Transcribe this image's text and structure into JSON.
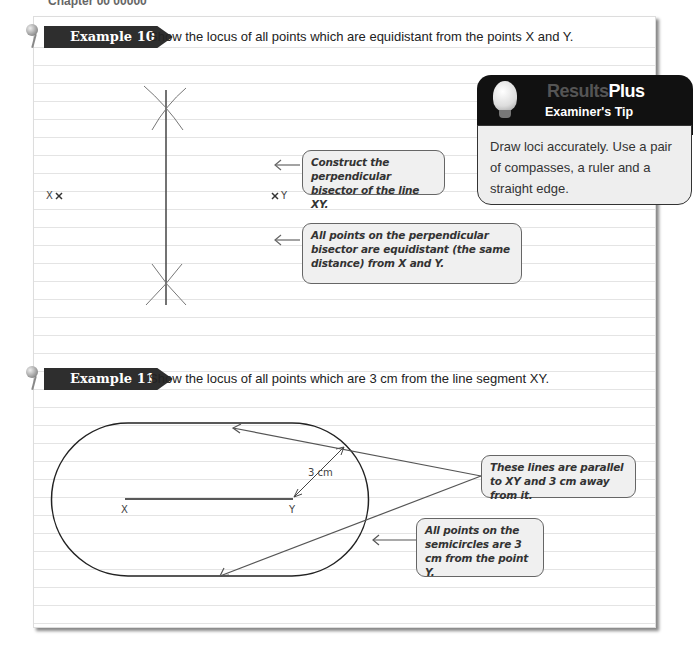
{
  "chapter_header": "Chapter 00 00000",
  "example10": {
    "badge": "Example 10",
    "prompt": "Show the locus of all points which are equidistant from the points X and Y.",
    "point_x_label": "X",
    "point_y_label": "Y",
    "callouts": [
      {
        "text": "Construct the perpendicular bisector of the line XY."
      },
      {
        "text": "All points on the perpendicular bisector are equidistant (the same distance) from X and Y."
      }
    ]
  },
  "tip": {
    "brand_prefix": "Results",
    "brand_suffix": "Plus",
    "title": "Examiner's Tip",
    "body": "Draw loci accurately. Use a pair of compasses, a ruler and a straight edge."
  },
  "example11": {
    "badge": "Example 11",
    "prompt": "Show the locus of all points which are 3 cm from the line segment XY.",
    "point_x_label": "X",
    "point_y_label": "Y",
    "distance_label": "3 cm",
    "callouts": [
      {
        "text": "These lines are parallel to XY and 3 cm away from it."
      },
      {
        "text": "All points on the semicircles are 3 cm from the point Y."
      }
    ]
  },
  "colors": {
    "badge_bg": "#2e2e2e",
    "callout_bg": "#f0f0f0",
    "tip_head_bg": "#111111",
    "rule_line": "#e4e4e4"
  }
}
